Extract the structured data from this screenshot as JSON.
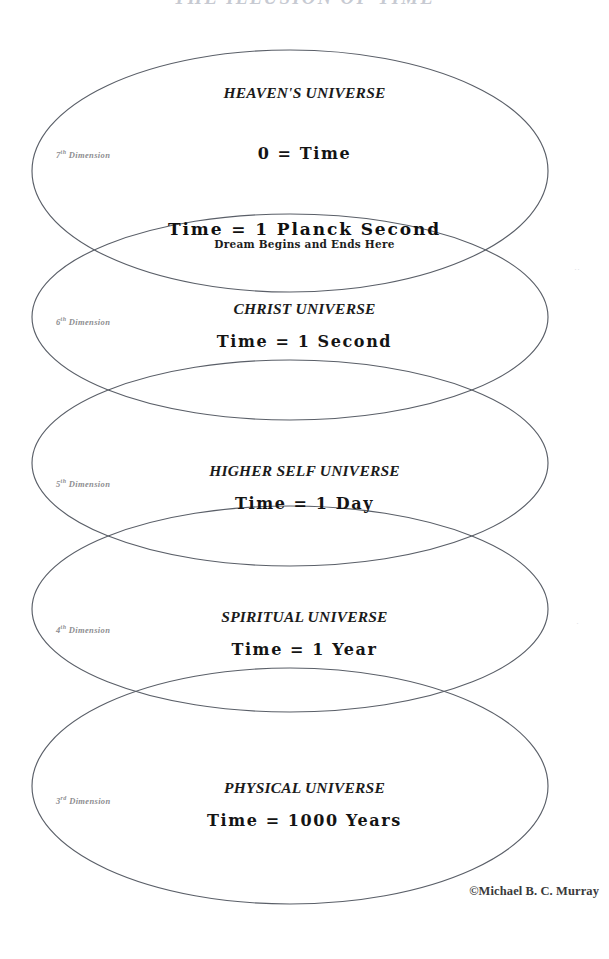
{
  "document": {
    "title": "THE ILLUSION OF TIME",
    "copyright": "©Michael B. C. Murray"
  },
  "diagram": {
    "type": "nested-overlapping-ellipses",
    "intersection_band": {
      "primary": "Time = 1 Planck Second",
      "secondary": "Dream Begins and Ends Here"
    },
    "zones": [
      {
        "id": "heavens-universe",
        "name": "HEAVEN'S UNIVERSE",
        "dimension_number": "7",
        "dimension_ordinal": "th",
        "dimension_label": "Dimension",
        "time_value": "0 = Time"
      },
      {
        "id": "christ-universe",
        "name": "CHRIST UNIVERSE",
        "dimension_number": "6",
        "dimension_ordinal": "th",
        "dimension_label": "Dimension",
        "time_value": "Time = 1 Second"
      },
      {
        "id": "higher-self-universe",
        "name": "HIGHER SELF UNIVERSE",
        "dimension_number": "5",
        "dimension_ordinal": "th",
        "dimension_label": "Dimension",
        "time_value": "Time = 1 Day"
      },
      {
        "id": "spiritual-universe",
        "name": "SPIRITUAL UNIVERSE",
        "dimension_number": "4",
        "dimension_ordinal": "th",
        "dimension_label": "Dimension",
        "time_value": "Time = 1 Year"
      },
      {
        "id": "physical-universe",
        "name": "PHYSICAL UNIVERSE",
        "dimension_number": "3",
        "dimension_ordinal": "rd",
        "dimension_label": "Dimension",
        "time_value": "Time = 1000 Years"
      }
    ]
  },
  "colors": {
    "page_background": "#ffffff",
    "ellipse_stroke": "#5a5f68",
    "primary_text": "#141414",
    "dimension_label_text": "#8d8d90",
    "title_text": "#9aa0ae"
  }
}
